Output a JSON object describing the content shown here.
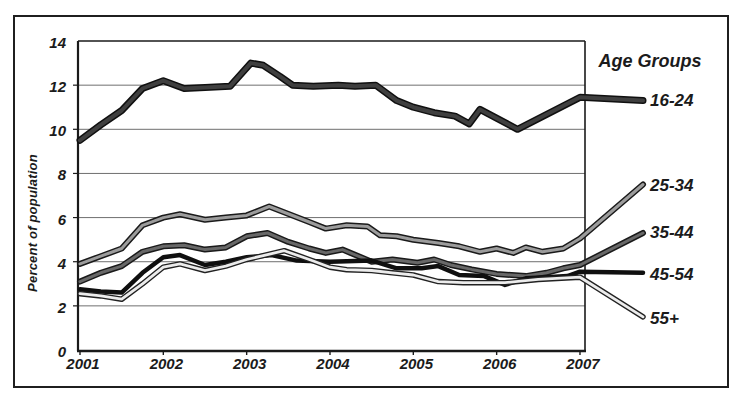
{
  "chart_data": {
    "type": "line",
    "title": "",
    "ylabel": "Percent of population",
    "xlabel": "",
    "legend_title": "Age Groups",
    "legend_position": "right",
    "grid": "horizontal",
    "xlim": [
      2001,
      2007
    ],
    "ylim": [
      0,
      14
    ],
    "x_tick_labels": [
      "2001",
      "2002",
      "2003",
      "2004",
      "2005",
      "2006",
      "2007"
    ],
    "x_tick_values": [
      2001,
      2002,
      2003,
      2004,
      2005,
      2006,
      2007
    ],
    "y_tick_labels": [
      "0",
      "2",
      "4",
      "6",
      "8",
      "10",
      "12",
      "14"
    ],
    "y_tick_values": [
      0,
      2,
      4,
      6,
      8,
      10,
      12,
      14
    ],
    "series": [
      {
        "name": "16-24",
        "core_color": "#3f3f3f",
        "edge_color": "#101010",
        "edge_width": 7,
        "core_width": 4,
        "label_y": 11.3,
        "leader_y": 11.3,
        "points": [
          [
            2001,
            9.5
          ],
          [
            2001.25,
            10.2
          ],
          [
            2001.5,
            10.85
          ],
          [
            2001.75,
            11.85
          ],
          [
            2002,
            12.2
          ],
          [
            2002.25,
            11.85
          ],
          [
            2002.5,
            11.9
          ],
          [
            2002.8,
            11.95
          ],
          [
            2003.05,
            13.0
          ],
          [
            2003.2,
            12.9
          ],
          [
            2003.4,
            12.4
          ],
          [
            2003.55,
            12.0
          ],
          [
            2003.8,
            11.95
          ],
          [
            2004.1,
            12.0
          ],
          [
            2004.3,
            11.95
          ],
          [
            2004.55,
            12.0
          ],
          [
            2004.8,
            11.3
          ],
          [
            2005,
            11.0
          ],
          [
            2005.25,
            10.75
          ],
          [
            2005.5,
            10.6
          ],
          [
            2005.67,
            10.25
          ],
          [
            2005.8,
            10.9
          ],
          [
            2006.25,
            10.0
          ],
          [
            2007,
            11.45
          ]
        ]
      },
      {
        "name": "25-34",
        "core_color": "#9c9c9c",
        "edge_color": "#1a1a1a",
        "edge_width": 6,
        "core_width": 3,
        "label_y": 7.42,
        "leader_y": 7.5,
        "points": [
          [
            2001,
            3.9
          ],
          [
            2001.25,
            4.25
          ],
          [
            2001.5,
            4.6
          ],
          [
            2001.75,
            5.65
          ],
          [
            2002,
            6.0
          ],
          [
            2002.2,
            6.15
          ],
          [
            2002.5,
            5.9
          ],
          [
            2002.75,
            6.0
          ],
          [
            2003,
            6.1
          ],
          [
            2003.27,
            6.5
          ],
          [
            2003.75,
            5.8
          ],
          [
            2003.95,
            5.5
          ],
          [
            2004.2,
            5.65
          ],
          [
            2004.45,
            5.6
          ],
          [
            2004.6,
            5.2
          ],
          [
            2004.8,
            5.15
          ],
          [
            2005,
            5.0
          ],
          [
            2005.3,
            4.85
          ],
          [
            2005.55,
            4.7
          ],
          [
            2005.8,
            4.45
          ],
          [
            2006,
            4.6
          ],
          [
            2006.2,
            4.4
          ],
          [
            2006.35,
            4.65
          ],
          [
            2006.55,
            4.45
          ],
          [
            2006.8,
            4.6
          ],
          [
            2007,
            5.05
          ]
        ]
      },
      {
        "name": "35-44",
        "core_color": "#686868",
        "edge_color": "#1a1a1a",
        "edge_width": 6,
        "core_width": 3,
        "label_y": 5.28,
        "leader_y": 5.3,
        "points": [
          [
            2001,
            3.1
          ],
          [
            2001.25,
            3.5
          ],
          [
            2001.5,
            3.8
          ],
          [
            2001.75,
            4.45
          ],
          [
            2002,
            4.7
          ],
          [
            2002.25,
            4.75
          ],
          [
            2002.5,
            4.55
          ],
          [
            2002.75,
            4.65
          ],
          [
            2003,
            5.15
          ],
          [
            2003.25,
            5.3
          ],
          [
            2003.5,
            4.9
          ],
          [
            2003.75,
            4.6
          ],
          [
            2003.95,
            4.4
          ],
          [
            2004.15,
            4.55
          ],
          [
            2004.5,
            4.0
          ],
          [
            2004.75,
            4.1
          ],
          [
            2005.05,
            3.95
          ],
          [
            2005.25,
            4.1
          ],
          [
            2005.45,
            3.85
          ],
          [
            2005.7,
            3.65
          ],
          [
            2006,
            3.45
          ],
          [
            2006.35,
            3.35
          ],
          [
            2006.6,
            3.5
          ],
          [
            2006.8,
            3.7
          ],
          [
            2007,
            3.85
          ]
        ]
      },
      {
        "name": "45-54",
        "core_color": "#0f0f0f",
        "edge_color": "#0f0f0f",
        "edge_width": 4.5,
        "core_width": 4.5,
        "label_y": 3.42,
        "leader_y": 3.5,
        "points": [
          [
            2001,
            2.75
          ],
          [
            2001.25,
            2.65
          ],
          [
            2001.5,
            2.6
          ],
          [
            2001.75,
            3.5
          ],
          [
            2002,
            4.2
          ],
          [
            2002.2,
            4.3
          ],
          [
            2002.5,
            3.85
          ],
          [
            2002.75,
            4.0
          ],
          [
            2003,
            4.2
          ],
          [
            2003.3,
            4.3
          ],
          [
            2003.6,
            4.05
          ],
          [
            2004,
            4.0
          ],
          [
            2004.5,
            4.05
          ],
          [
            2004.8,
            3.7
          ],
          [
            2005.1,
            3.7
          ],
          [
            2005.3,
            3.8
          ],
          [
            2005.55,
            3.4
          ],
          [
            2005.85,
            3.35
          ],
          [
            2006.1,
            2.95
          ],
          [
            2006.35,
            3.25
          ],
          [
            2006.6,
            3.3
          ],
          [
            2006.85,
            3.35
          ],
          [
            2007,
            3.55
          ]
        ]
      },
      {
        "name": "55+",
        "core_color": "#ececec",
        "edge_color": "#222222",
        "edge_width": 5.5,
        "core_width": 2.8,
        "label_y": 1.4,
        "leader_y": 1.5,
        "points": [
          [
            2001,
            2.55
          ],
          [
            2001.25,
            2.45
          ],
          [
            2001.5,
            2.3
          ],
          [
            2001.75,
            3.0
          ],
          [
            2002,
            3.75
          ],
          [
            2002.2,
            3.9
          ],
          [
            2002.5,
            3.6
          ],
          [
            2002.75,
            3.8
          ],
          [
            2003,
            4.1
          ],
          [
            2003.45,
            4.5
          ],
          [
            2003.75,
            4.1
          ],
          [
            2004,
            3.75
          ],
          [
            2004.2,
            3.64
          ],
          [
            2004.5,
            3.6
          ],
          [
            2004.75,
            3.5
          ],
          [
            2005,
            3.4
          ],
          [
            2005.3,
            3.1
          ],
          [
            2005.6,
            3.05
          ],
          [
            2006.1,
            3.05
          ],
          [
            2006.5,
            3.2
          ],
          [
            2007,
            3.3
          ]
        ]
      }
    ]
  },
  "colors": {
    "background": "#ffffff",
    "frame_border": "#1f1f1f",
    "grid": "#6f6f6f",
    "axis": "#1a1a1a",
    "text": "#1b1b1b"
  }
}
